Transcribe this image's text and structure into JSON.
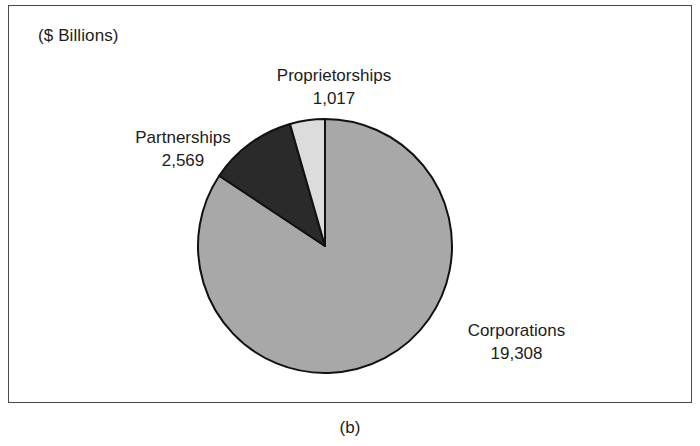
{
  "figure": {
    "caption": "(b)",
    "units_label": "($ Billions)"
  },
  "chart_data": {
    "type": "pie",
    "title": "",
    "subtitle": "",
    "units": "($ Billions)",
    "xlabel": "",
    "ylabel": "",
    "legend_position": "none",
    "grid": false,
    "labels_on_slices": true,
    "start_angle_deg": 90,
    "direction": "counterclockwise",
    "total": 22894,
    "categories": [
      "Proprietorships",
      "Partnerships",
      "Corporations"
    ],
    "values": [
      1017,
      2569,
      19308
    ],
    "value_labels": [
      "1,017",
      "2,569",
      "19,308"
    ],
    "percentages": [
      4.4,
      11.2,
      84.3
    ],
    "slice_colors": [
      "#dcdcdc",
      "#2a2a2a",
      "#a8a8a8"
    ],
    "slices": [
      {
        "name": "Proprietorships",
        "value": 1017,
        "value_label": "1,017",
        "percent": 4.4,
        "color": "#dcdcdc",
        "start_deg": 0,
        "sweep_deg": 16
      },
      {
        "name": "Partnerships",
        "value": 2569,
        "value_label": "2,569",
        "percent": 11.2,
        "color": "#2a2a2a",
        "start_deg": 16,
        "sweep_deg": 40.4
      },
      {
        "name": "Corporations",
        "value": 19308,
        "value_label": "19,308",
        "percent": 84.3,
        "color": "#a8a8a8",
        "start_deg": 56.4,
        "sweep_deg": 303.6
      }
    ]
  },
  "labels": {
    "proprietorships": {
      "name": "Proprietorships",
      "value": "1,017"
    },
    "partnerships": {
      "name": "Partnerships",
      "value": "2,569"
    },
    "corporations": {
      "name": "Corporations",
      "value": "19,308"
    }
  },
  "colors": {
    "slice_light": "#dcdcdc",
    "slice_dark": "#2a2a2a",
    "slice_mid": "#a8a8a8",
    "outline": "#111111",
    "frame": "#4a4a4a",
    "text": "#1c1c1c",
    "background": "#ffffff"
  }
}
